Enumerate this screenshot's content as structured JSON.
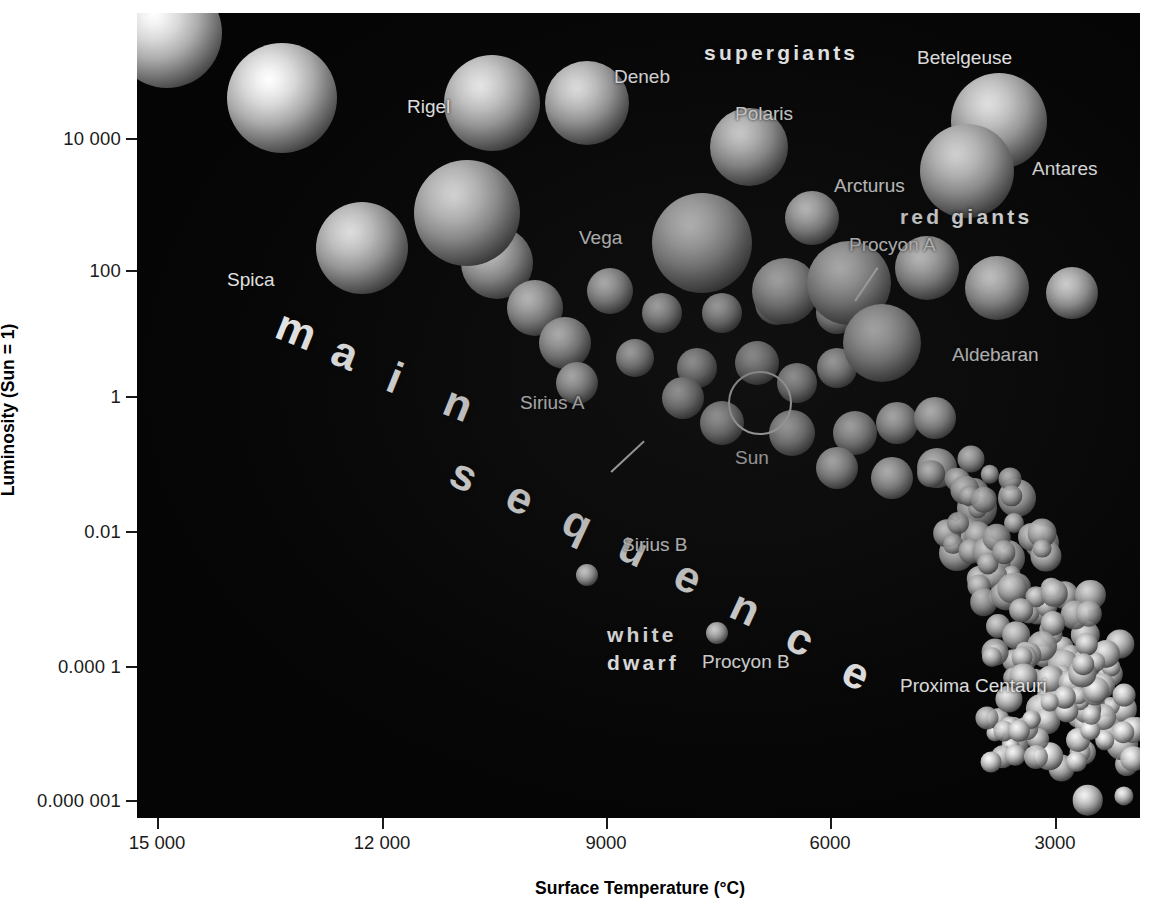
{
  "chart_data": {
    "type": "scatter",
    "xlabel": "Surface Temperature (°C)",
    "ylabel": "Luminosity (Sun = 1)",
    "x_ticks": [
      "15 000",
      "12 000",
      "9000",
      "6000",
      "3000"
    ],
    "x_tick_values": [
      15000,
      12000,
      9000,
      6000,
      3000
    ],
    "y_ticks": [
      "10 000",
      "100",
      "1",
      "0.01",
      "0.000 1",
      "0.000 001"
    ],
    "y_tick_values": [
      10000,
      100,
      1,
      0.01,
      0.0001,
      1e-06
    ],
    "x_axis_direction": "reversed",
    "y_axis_scale": "log",
    "xlim": [
      15750,
      2000
    ],
    "ylim": [
      1e-06,
      1000000
    ],
    "grid": false,
    "legend": "none",
    "background": "#050505",
    "named_stars": [
      {
        "name": "Spica",
        "temperature_C": 14000,
        "luminosity_sun": 120,
        "size_px": 74
      },
      {
        "name": "Rigel",
        "temperature_C": 11000,
        "luminosity_sun": 40000,
        "size_px": 84
      },
      {
        "name": "Deneb",
        "temperature_C": 9500,
        "luminosity_sun": 33000,
        "size_px": 78
      },
      {
        "name": "Vega",
        "temperature_C": 9600,
        "luminosity_sun": 55,
        "size_px": 60
      },
      {
        "name": "Polaris",
        "temperature_C": 7000,
        "luminosity_sun": 5000,
        "size_px": 80
      },
      {
        "name": "Betelgeuse",
        "temperature_C": 3200,
        "luminosity_sun": 17000,
        "size_px": 95
      },
      {
        "name": "Antares",
        "temperature_C": 3400,
        "luminosity_sun": 9000,
        "size_px": 95
      },
      {
        "name": "Arcturus",
        "temperature_C": 4300,
        "luminosity_sun": 180,
        "size_px": 54
      },
      {
        "name": "Procyon A",
        "temperature_C": 6500,
        "luminosity_sun": 7,
        "size_px": 44
      },
      {
        "name": "Aldebaran",
        "temperature_C": 3900,
        "luminosity_sun": 150,
        "size_px": 80
      },
      {
        "name": "Sirius A",
        "temperature_C": 9400,
        "luminosity_sun": 25,
        "size_px": 40
      },
      {
        "name": "Sun",
        "temperature_C": 5500,
        "luminosity_sun": 1,
        "size_px": 44
      },
      {
        "name": "Sirius B",
        "temperature_C": 8600,
        "luminosity_sun": 0.0028,
        "size_px": 22
      },
      {
        "name": "Procyon B",
        "temperature_C": 7000,
        "luminosity_sun": 0.00055,
        "size_px": 20
      },
      {
        "name": "Proxima Centauri",
        "temperature_C": 2700,
        "luminosity_sun": 5e-05,
        "size_px": 15
      }
    ],
    "region_labels": [
      "supergiants",
      "red giants",
      "main sequence",
      "white dwarf"
    ]
  },
  "axes": {
    "y_title": "Luminosity (Sun = 1)",
    "x_title": "Surface Temperature (°C)",
    "y_ticks": [
      {
        "label": "10 000",
        "top": 138
      },
      {
        "label": "100",
        "top": 270
      },
      {
        "label": "1",
        "top": 396
      },
      {
        "label": "0.01",
        "top": 531
      },
      {
        "label": "0.000 1",
        "top": 666
      },
      {
        "label": "0.000 001",
        "top": 800
      }
    ],
    "x_ticks": [
      {
        "label": "15 000",
        "left": 157
      },
      {
        "label": "12 000",
        "left": 382
      },
      {
        "label": "9000",
        "left": 606
      },
      {
        "label": "6000",
        "left": 830
      },
      {
        "label": "3000",
        "left": 1055
      }
    ]
  },
  "labels": {
    "spica": "Spica",
    "rigel": "Rigel",
    "deneb": "Deneb",
    "vega": "Vega",
    "polaris": "Polaris",
    "betelgeuse": "Betelgeuse",
    "antares": "Antares",
    "arcturus": "Arcturus",
    "procyon_a": "Procyon A",
    "aldebaran": "Aldebaran",
    "sirius_a": "Sirius A",
    "sun": "Sun",
    "sirius_b": "Sirius B",
    "procyon_b": "Procyon B",
    "proxima_centauri": "Proxima Centauri"
  },
  "regions": {
    "supergiants": "supergiants",
    "red_giants": "red giants",
    "white_dwarf_line1": "white",
    "white_dwarf_line2": "dwarf",
    "main": "main",
    "sequence": "sequence"
  },
  "colors": {
    "plot_background": "#050505",
    "star_core": "#ffffff",
    "label_text": "#f2f2f2",
    "axis": "#1a1a1a",
    "page_background": "#ffffff"
  }
}
